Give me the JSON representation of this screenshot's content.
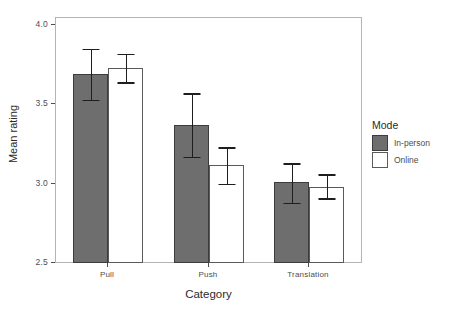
{
  "chart_data": {
    "type": "bar",
    "title": "",
    "xlabel": "Category",
    "ylabel": "Mean rating",
    "categories": [
      "Pull",
      "Push",
      "Translation"
    ],
    "ylim": [
      2.5,
      4.0
    ],
    "yticks": [
      "2.5",
      "3.0",
      "3.5",
      "4.0"
    ],
    "ytick_values": [
      2.5,
      3.0,
      3.5,
      4.0
    ],
    "grid": false,
    "legend": {
      "title": "Mode",
      "position": "right",
      "entries": [
        {
          "label": "In-person",
          "key": "dark-filled-square",
          "color": "#6e6e6e"
        },
        {
          "label": "Online",
          "key": "white-filled-square",
          "color": "#ffffff"
        }
      ]
    },
    "series": [
      {
        "name": "In-person",
        "color": "#6e6e6e",
        "values": [
          3.69,
          3.37,
          3.01
        ],
        "err_low": [
          3.53,
          3.17,
          2.88
        ],
        "err_high": [
          3.85,
          3.57,
          3.13
        ]
      },
      {
        "name": "Online",
        "color": "#ffffff",
        "values": [
          3.73,
          3.12,
          2.98
        ],
        "err_low": [
          3.64,
          3.0,
          2.91
        ],
        "err_high": [
          3.82,
          3.23,
          3.06
        ]
      }
    ],
    "error_bar_type": "95% confidence interval"
  },
  "axes": {
    "y_title": "Mean rating",
    "x_title": "Category",
    "y_tick_labels": [
      "4.0",
      "3.5",
      "3.0",
      "2.5"
    ],
    "x_tick_labels": [
      "Pull",
      "Push",
      "Translation"
    ]
  },
  "legend": {
    "title": "Mode",
    "items": [
      {
        "label": "In-person"
      },
      {
        "label": "Online"
      }
    ]
  }
}
